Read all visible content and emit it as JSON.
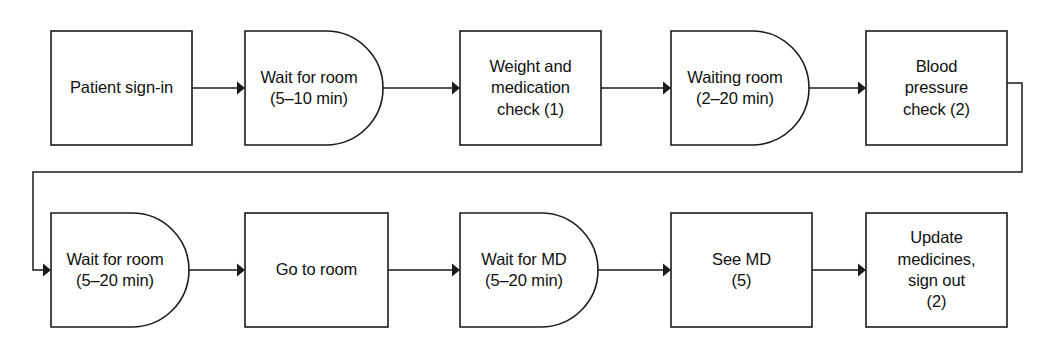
{
  "diagram": {
    "type": "process-flowchart",
    "colors": {
      "background": "#ffffff",
      "stroke": "#1b1b1b",
      "text": "#111111",
      "fill": "#ffffff"
    },
    "legend_note": "Numbers in parentheses indicate staff/resource count for the step",
    "nodes": [
      {
        "id": "patient-sign-in",
        "shape": "rectangle",
        "row": 1,
        "order": 1,
        "lines": [
          "Patient sign-in"
        ],
        "duration": "",
        "resource_count": ""
      },
      {
        "id": "wait-for-room-1",
        "shape": "d-shape",
        "row": 1,
        "order": 2,
        "lines": [
          "Wait for room",
          "(5–10 min)"
        ],
        "duration": "5–10 min",
        "resource_count": ""
      },
      {
        "id": "weight-medication-check",
        "shape": "rectangle",
        "row": 1,
        "order": 3,
        "lines": [
          "Weight and",
          "medication",
          "check (1)"
        ],
        "duration": "",
        "resource_count": "1"
      },
      {
        "id": "waiting-room",
        "shape": "d-shape",
        "row": 1,
        "order": 4,
        "lines": [
          "Waiting room",
          "(2–20 min)"
        ],
        "duration": "2–20 min",
        "resource_count": ""
      },
      {
        "id": "blood-pressure-check",
        "shape": "rectangle",
        "row": 1,
        "order": 5,
        "lines": [
          "Blood",
          "pressure",
          "check (2)"
        ],
        "duration": "",
        "resource_count": "2"
      },
      {
        "id": "wait-for-room-2",
        "shape": "d-shape",
        "row": 2,
        "order": 1,
        "lines": [
          "Wait for room",
          "(5–20 min)"
        ],
        "duration": "5–20 min",
        "resource_count": ""
      },
      {
        "id": "go-to-room",
        "shape": "rectangle",
        "row": 2,
        "order": 2,
        "lines": [
          "Go to room"
        ],
        "duration": "",
        "resource_count": ""
      },
      {
        "id": "wait-for-md",
        "shape": "d-shape",
        "row": 2,
        "order": 3,
        "lines": [
          "Wait for MD",
          "(5–20 min)"
        ],
        "duration": "5–20 min",
        "resource_count": ""
      },
      {
        "id": "see-md",
        "shape": "rectangle",
        "row": 2,
        "order": 4,
        "lines": [
          "See MD",
          "(5)"
        ],
        "duration": "",
        "resource_count": "5"
      },
      {
        "id": "update-medicines-sign-out",
        "shape": "rectangle",
        "row": 2,
        "order": 5,
        "lines": [
          "Update",
          "medicines,",
          "sign out",
          "(2)"
        ],
        "duration": "",
        "resource_count": "2"
      }
    ],
    "connectors": [
      {
        "id": "c1",
        "from": "patient-sign-in",
        "to": "wait-for-room-1",
        "kind": "straight-arrow"
      },
      {
        "id": "c2",
        "from": "wait-for-room-1",
        "to": "weight-medication-check",
        "kind": "straight-arrow"
      },
      {
        "id": "c3",
        "from": "weight-medication-check",
        "to": "waiting-room",
        "kind": "straight-arrow"
      },
      {
        "id": "c4",
        "from": "waiting-room",
        "to": "blood-pressure-check",
        "kind": "straight-arrow"
      },
      {
        "id": "c5",
        "from": "blood-pressure-check",
        "to": "wait-for-room-2",
        "kind": "wrap-around-arrow"
      },
      {
        "id": "c6",
        "from": "wait-for-room-2",
        "to": "go-to-room",
        "kind": "straight-arrow"
      },
      {
        "id": "c7",
        "from": "go-to-room",
        "to": "wait-for-md",
        "kind": "straight-arrow"
      },
      {
        "id": "c8",
        "from": "wait-for-md",
        "to": "see-md",
        "kind": "straight-arrow"
      },
      {
        "id": "c9",
        "from": "see-md",
        "to": "update-medicines-sign-out",
        "kind": "straight-arrow"
      }
    ]
  }
}
